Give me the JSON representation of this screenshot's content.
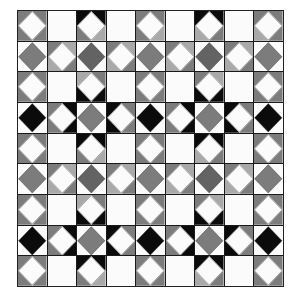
{
  "pattern": {
    "title": "Quilt tile pattern",
    "rows": 9,
    "cols": 9,
    "palette": {
      "W": "#fbfbfb",
      "G": "#7c7c7c",
      "L": "#a9a9a9",
      "D": "#636363",
      "K": "#0b0b0b",
      "line": "#1a1a1a"
    },
    "cells": [
      [
        {
          "d": "W",
          "c": [
            "G",
            "G",
            "G",
            "G"
          ]
        },
        {
          "d": "X",
          "c": [
            "W",
            "W",
            "W",
            "W"
          ]
        },
        {
          "d": "W",
          "c": [
            "K",
            "K",
            "G",
            "L"
          ]
        },
        {
          "d": "X",
          "c": [
            "W",
            "W",
            "W",
            "W"
          ]
        },
        {
          "d": "W",
          "c": [
            "G",
            "G",
            "G",
            "L"
          ]
        },
        {
          "d": "X",
          "c": [
            "W",
            "W",
            "W",
            "W"
          ]
        },
        {
          "d": "W",
          "c": [
            "K",
            "K",
            "L",
            "G"
          ]
        },
        {
          "d": "X",
          "c": [
            "W",
            "W",
            "W",
            "W"
          ]
        },
        {
          "d": "W",
          "c": [
            "G",
            "G",
            "L",
            "G"
          ]
        }
      ],
      [
        {
          "d": "G",
          "c": [
            "W",
            "W",
            "W",
            "W"
          ]
        },
        {
          "d": "W",
          "c": [
            "G",
            "L",
            "L",
            "G"
          ]
        },
        {
          "d": "D",
          "c": [
            "W",
            "W",
            "W",
            "W"
          ]
        },
        {
          "d": "W",
          "c": [
            "G",
            "L",
            "L",
            "G"
          ]
        },
        {
          "d": "G",
          "c": [
            "W",
            "W",
            "W",
            "W"
          ]
        },
        {
          "d": "W",
          "c": [
            "G",
            "L",
            "L",
            "G"
          ]
        },
        {
          "d": "D",
          "c": [
            "W",
            "W",
            "W",
            "W"
          ]
        },
        {
          "d": "W",
          "c": [
            "G",
            "L",
            "L",
            "G"
          ]
        },
        {
          "d": "G",
          "c": [
            "W",
            "W",
            "W",
            "W"
          ]
        }
      ],
      [
        {
          "d": "W",
          "c": [
            "G",
            "G",
            "G",
            "G"
          ]
        },
        {
          "d": "X",
          "c": [
            "W",
            "W",
            "W",
            "W"
          ]
        },
        {
          "d": "W",
          "c": [
            "L",
            "G",
            "K",
            "K"
          ]
        },
        {
          "d": "X",
          "c": [
            "W",
            "W",
            "W",
            "W"
          ]
        },
        {
          "d": "W",
          "c": [
            "G",
            "G",
            "G",
            "G"
          ]
        },
        {
          "d": "X",
          "c": [
            "W",
            "W",
            "W",
            "W"
          ]
        },
        {
          "d": "W",
          "c": [
            "G",
            "L",
            "K",
            "K"
          ]
        },
        {
          "d": "X",
          "c": [
            "W",
            "W",
            "W",
            "W"
          ]
        },
        {
          "d": "W",
          "c": [
            "G",
            "G",
            "G",
            "G"
          ]
        }
      ],
      [
        {
          "d": "K",
          "c": [
            "W",
            "W",
            "W",
            "W"
          ]
        },
        {
          "d": "W",
          "c": [
            "G",
            "K",
            "G",
            "K"
          ]
        },
        {
          "d": "G",
          "c": [
            "W",
            "W",
            "W",
            "W"
          ]
        },
        {
          "d": "W",
          "c": [
            "K",
            "G",
            "K",
            "G"
          ]
        },
        {
          "d": "K",
          "c": [
            "W",
            "W",
            "W",
            "W"
          ]
        },
        {
          "d": "W",
          "c": [
            "G",
            "K",
            "G",
            "K"
          ]
        },
        {
          "d": "G",
          "c": [
            "W",
            "W",
            "W",
            "W"
          ]
        },
        {
          "d": "W",
          "c": [
            "K",
            "G",
            "K",
            "G"
          ]
        },
        {
          "d": "K",
          "c": [
            "W",
            "W",
            "W",
            "W"
          ]
        }
      ],
      [
        {
          "d": "W",
          "c": [
            "G",
            "G",
            "G",
            "G"
          ]
        },
        {
          "d": "X",
          "c": [
            "W",
            "W",
            "W",
            "W"
          ]
        },
        {
          "d": "W",
          "c": [
            "K",
            "K",
            "G",
            "L"
          ]
        },
        {
          "d": "X",
          "c": [
            "W",
            "W",
            "W",
            "W"
          ]
        },
        {
          "d": "W",
          "c": [
            "G",
            "G",
            "G",
            "G"
          ]
        },
        {
          "d": "X",
          "c": [
            "W",
            "W",
            "W",
            "W"
          ]
        },
        {
          "d": "W",
          "c": [
            "K",
            "K",
            "L",
            "G"
          ]
        },
        {
          "d": "X",
          "c": [
            "W",
            "W",
            "W",
            "W"
          ]
        },
        {
          "d": "W",
          "c": [
            "G",
            "G",
            "G",
            "G"
          ]
        }
      ],
      [
        {
          "d": "G",
          "c": [
            "W",
            "W",
            "W",
            "W"
          ]
        },
        {
          "d": "W",
          "c": [
            "G",
            "L",
            "L",
            "G"
          ]
        },
        {
          "d": "D",
          "c": [
            "W",
            "W",
            "W",
            "W"
          ]
        },
        {
          "d": "W",
          "c": [
            "G",
            "L",
            "L",
            "G"
          ]
        },
        {
          "d": "G",
          "c": [
            "W",
            "W",
            "W",
            "W"
          ]
        },
        {
          "d": "W",
          "c": [
            "G",
            "L",
            "L",
            "G"
          ]
        },
        {
          "d": "D",
          "c": [
            "W",
            "W",
            "W",
            "W"
          ]
        },
        {
          "d": "W",
          "c": [
            "G",
            "L",
            "L",
            "G"
          ]
        },
        {
          "d": "G",
          "c": [
            "W",
            "W",
            "W",
            "W"
          ]
        }
      ],
      [
        {
          "d": "W",
          "c": [
            "G",
            "G",
            "G",
            "G"
          ]
        },
        {
          "d": "X",
          "c": [
            "W",
            "W",
            "W",
            "W"
          ]
        },
        {
          "d": "W",
          "c": [
            "L",
            "G",
            "K",
            "K"
          ]
        },
        {
          "d": "X",
          "c": [
            "W",
            "W",
            "W",
            "W"
          ]
        },
        {
          "d": "W",
          "c": [
            "G",
            "G",
            "G",
            "G"
          ]
        },
        {
          "d": "X",
          "c": [
            "W",
            "W",
            "W",
            "W"
          ]
        },
        {
          "d": "W",
          "c": [
            "G",
            "L",
            "K",
            "K"
          ]
        },
        {
          "d": "X",
          "c": [
            "W",
            "W",
            "W",
            "W"
          ]
        },
        {
          "d": "W",
          "c": [
            "G",
            "G",
            "G",
            "G"
          ]
        }
      ],
      [
        {
          "d": "K",
          "c": [
            "W",
            "W",
            "W",
            "W"
          ]
        },
        {
          "d": "W",
          "c": [
            "G",
            "K",
            "G",
            "K"
          ]
        },
        {
          "d": "G",
          "c": [
            "W",
            "W",
            "W",
            "W"
          ]
        },
        {
          "d": "W",
          "c": [
            "K",
            "G",
            "K",
            "G"
          ]
        },
        {
          "d": "K",
          "c": [
            "W",
            "W",
            "W",
            "W"
          ]
        },
        {
          "d": "W",
          "c": [
            "G",
            "K",
            "G",
            "K"
          ]
        },
        {
          "d": "G",
          "c": [
            "W",
            "W",
            "W",
            "W"
          ]
        },
        {
          "d": "W",
          "c": [
            "K",
            "G",
            "K",
            "G"
          ]
        },
        {
          "d": "K",
          "c": [
            "W",
            "W",
            "W",
            "W"
          ]
        }
      ],
      [
        {
          "d": "W",
          "c": [
            "G",
            "G",
            "G",
            "G"
          ]
        },
        {
          "d": "X",
          "c": [
            "W",
            "W",
            "W",
            "W"
          ]
        },
        {
          "d": "W",
          "c": [
            "K",
            "K",
            "G",
            "L"
          ]
        },
        {
          "d": "X",
          "c": [
            "W",
            "W",
            "W",
            "W"
          ]
        },
        {
          "d": "W",
          "c": [
            "G",
            "G",
            "G",
            "G"
          ]
        },
        {
          "d": "X",
          "c": [
            "W",
            "W",
            "W",
            "W"
          ]
        },
        {
          "d": "W",
          "c": [
            "K",
            "K",
            "L",
            "G"
          ]
        },
        {
          "d": "X",
          "c": [
            "W",
            "W",
            "W",
            "W"
          ]
        },
        {
          "d": "W",
          "c": [
            "G",
            "G",
            "G",
            "G"
          ]
        }
      ]
    ]
  }
}
